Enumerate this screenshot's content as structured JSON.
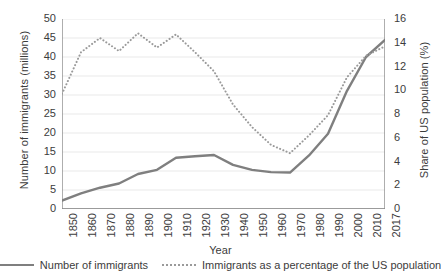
{
  "chart_data": {
    "type": "line",
    "title": "",
    "xlabel": "Year",
    "categories": [
      "1850",
      "1860",
      "1870",
      "1880",
      "1890",
      "1900",
      "1910",
      "1920",
      "1930",
      "1940",
      "1950",
      "1960",
      "1970",
      "1980",
      "1990",
      "2000",
      "2010",
      "2017"
    ],
    "grid": true,
    "legend_position": "bottom",
    "axes": {
      "left": {
        "label": "Number of immigrants (millions)",
        "min": 0,
        "max": 50,
        "step": 5,
        "ticks": [
          "0",
          "5",
          "10",
          "15",
          "20",
          "25",
          "30",
          "35",
          "40",
          "45",
          "50"
        ]
      },
      "right": {
        "label": "Share of US population (%)",
        "min": 0,
        "max": 16,
        "step": 2,
        "ticks": [
          "0",
          "2",
          "4",
          "6",
          "8",
          "10",
          "12",
          "14",
          "16"
        ]
      }
    },
    "series": [
      {
        "name": "Number of immigrants",
        "axis": "left",
        "style": "solid",
        "color": "#7f7f7f",
        "unit": "millions",
        "values": [
          2.2,
          4.1,
          5.6,
          6.7,
          9.2,
          10.3,
          13.5,
          13.9,
          14.2,
          11.6,
          10.3,
          9.7,
          9.6,
          14.1,
          19.8,
          31.1,
          40.0,
          44.5
        ]
      },
      {
        "name": "Immigrants as a percentage of the US population",
        "axis": "right",
        "style": "dotted",
        "color": "#9a9a9a",
        "unit": "%",
        "values": [
          9.7,
          13.2,
          14.4,
          13.3,
          14.8,
          13.6,
          14.7,
          13.2,
          11.6,
          8.8,
          6.9,
          5.4,
          4.7,
          6.2,
          7.9,
          11.1,
          12.9,
          13.7
        ]
      }
    ]
  },
  "legend": {
    "items": [
      {
        "label": "Number of immigrants",
        "style": "solid"
      },
      {
        "label": "Immigrants as a percentage of the US population",
        "style": "dotted"
      }
    ]
  }
}
